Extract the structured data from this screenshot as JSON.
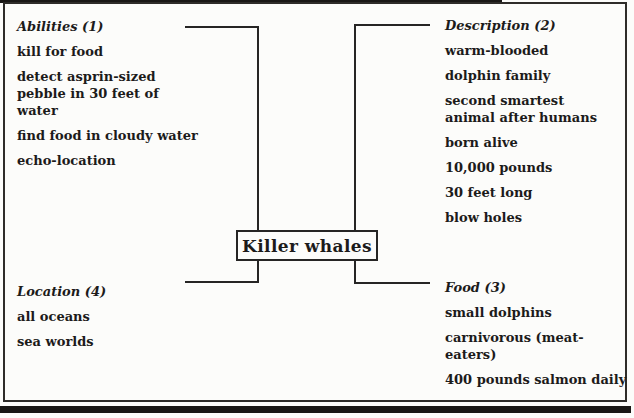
{
  "center": {
    "label": "Killer whales"
  },
  "sections": {
    "abilities": {
      "heading": "Abilities (1)",
      "items": [
        "kill for food",
        "detect asprin-sized pebble in 30 feet of water",
        "find food in cloudy water",
        "echo-location"
      ]
    },
    "description": {
      "heading": "Description (2)",
      "items": [
        "warm-blooded",
        "dolphin family",
        "second smartest animal after humans",
        "born alive",
        "10,000 pounds",
        "30 feet long",
        "blow holes"
      ]
    },
    "food": {
      "heading": "Food (3)",
      "items": [
        "small dolphins",
        "carnivorous (meat-eaters)",
        "400 pounds salmon daily"
      ]
    },
    "location": {
      "heading": "Location (4)",
      "items": [
        "all oceans",
        "sea worlds"
      ]
    }
  },
  "colors": {
    "ink": "#1c1b1a",
    "paper": "#fcfcfa",
    "line": "#262524"
  }
}
